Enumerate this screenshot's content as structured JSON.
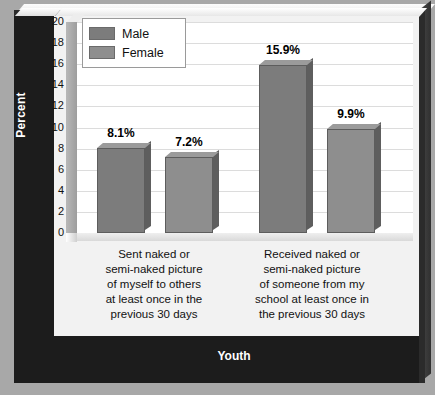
{
  "chart_data": {
    "type": "bar",
    "title": "",
    "subtitle": "",
    "xlabel": "Youth",
    "ylabel": "Percent",
    "ylim": [
      0,
      20
    ],
    "ytick_labels": [
      "20",
      "18",
      "16",
      "14",
      "12",
      "10",
      "8",
      "6",
      "4",
      "2",
      "0"
    ],
    "ytick_values": [
      20,
      18,
      16,
      14,
      12,
      10,
      8,
      6,
      4,
      2,
      0
    ],
    "grid": true,
    "legend_position": "top-left",
    "categories": [
      "Sent naked or semi-naked picture of myself to others at least once in the previous 30 days",
      "Received naked or semi-naked picture of someone from my school at least once in the previous 30 days"
    ],
    "category_lines": [
      [
        "Sent naked or",
        "semi-naked picture",
        "of myself to others",
        "at least once in the",
        "previous 30 days"
      ],
      [
        "Received naked or",
        "semi-naked picture",
        "of someone from my",
        "school at least once in",
        "the previous 30 days"
      ]
    ],
    "series": [
      {
        "name": "Male",
        "color": "#7c7c7c",
        "values": [
          8.1,
          9.9
        ],
        "value_labels": [
          "8.1%",
          "15.9%"
        ]
      },
      {
        "name": "Female",
        "color": "#8e8e8e",
        "values": [
          7.2,
          9.9
        ],
        "value_labels": [
          "7.2%",
          "9.9%"
        ]
      }
    ],
    "bars": [
      {
        "group": 0,
        "series": "Male",
        "value": 8.1,
        "label": "8.1%",
        "color": "#7c7c7c"
      },
      {
        "group": 0,
        "series": "Female",
        "value": 7.2,
        "label": "7.2%",
        "color": "#8e8e8e"
      },
      {
        "group": 1,
        "series": "Male",
        "value": 15.9,
        "label": "15.9%",
        "color": "#7c7c7c"
      },
      {
        "group": 1,
        "series": "Female",
        "value": 9.9,
        "label": "9.9%",
        "color": "#8e8e8e"
      }
    ]
  },
  "legend": {
    "items": [
      {
        "label": "Male",
        "color": "#7c7c7c"
      },
      {
        "label": "Female",
        "color": "#8e8e8e"
      }
    ]
  },
  "colors": {
    "frame": "#1c1c1c",
    "panel": "#f2f2f2",
    "plot_background": "#ffffff",
    "gridline": "#dcdcdc",
    "axis_title_text": "#ffffff",
    "male_bar": "#7c7c7c",
    "female_bar": "#8e8e8e",
    "page_background": "#a8a8a8"
  }
}
